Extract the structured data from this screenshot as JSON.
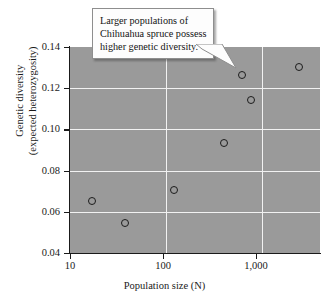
{
  "chart_data": {
    "type": "scatter",
    "title": "",
    "xlabel": "Population size (N)",
    "ylabel": "Genetic diversity\n(expected heterozygosity)",
    "ylabel_line1": "Genetic diversity",
    "ylabel_line2": "(expected heterozygosity)",
    "xscale": "log",
    "yscale": "linear",
    "xlim": [
      10,
      4000
    ],
    "ylim": [
      0.04,
      0.14
    ],
    "xticks": [
      10,
      100,
      1000
    ],
    "xticklabels": [
      "10",
      "100",
      "1,000"
    ],
    "yticks": [
      0.04,
      0.06,
      0.08,
      0.1,
      0.12,
      0.14
    ],
    "yticklabels": [
      "0.04",
      "0.06",
      "0.08",
      "0.10",
      "0.12",
      "0.14"
    ],
    "grid": true,
    "gridlines_h": [
      0.06,
      0.08,
      0.1,
      0.12
    ],
    "gridlines_v": [
      100,
      1000
    ],
    "legend": null,
    "points": [
      {
        "x": 17,
        "y": 0.0655
      },
      {
        "x": 37,
        "y": 0.0548
      },
      {
        "x": 120,
        "y": 0.0705
      },
      {
        "x": 400,
        "y": 0.0935
      },
      {
        "x": 620,
        "y": 0.1262
      },
      {
        "x": 760,
        "y": 0.1145
      },
      {
        "x": 2400,
        "y": 0.1302
      }
    ],
    "annotations": [
      {
        "name": "callout",
        "line1": "Larger populations of",
        "line2": "Chihuahua spruce possess",
        "line3": "higher genetic diversity.",
        "points_to": {
          "x": 620,
          "y": 0.1262
        }
      }
    ],
    "colors": {
      "panel_background": "#9a9a9a",
      "gridline": "#f2f2f2",
      "axis": "#1a1a1a",
      "marker_edge": "#1c1c1c",
      "marker_face": "none",
      "callout_background": "#fdfdfd",
      "callout_border": "#8e8e8e",
      "figure_background": "#ffffff"
    }
  }
}
